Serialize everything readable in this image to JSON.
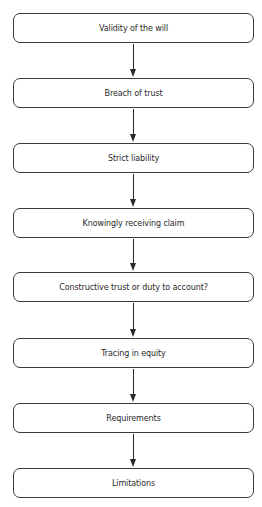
{
  "diagram": {
    "type": "vertical-flowchart",
    "colors": {
      "border": "#3a3a3a",
      "text": "#2a2a2a",
      "background": "#ffffff",
      "arrow": "#2a2a2a"
    },
    "nodes": [
      {
        "id": "n1",
        "label": "Validity of the will",
        "top": 13
      },
      {
        "id": "n2",
        "label": "Breach of trust",
        "top": 78
      },
      {
        "id": "n3",
        "label": "Strict liability",
        "top": 143
      },
      {
        "id": "n4",
        "label": "Knowingly receiving claim",
        "top": 208
      },
      {
        "id": "n5",
        "label": "Constructive trust or duty to account?",
        "top": 272
      },
      {
        "id": "n6",
        "label": "Tracing in equity",
        "top": 338
      },
      {
        "id": "n7",
        "label": "Requirements",
        "top": 403
      },
      {
        "id": "n8",
        "label": "Limitations",
        "top": 468
      }
    ],
    "edges": [
      {
        "from": "n1",
        "to": "n2"
      },
      {
        "from": "n2",
        "to": "n3"
      },
      {
        "from": "n3",
        "to": "n4"
      },
      {
        "from": "n4",
        "to": "n5"
      },
      {
        "from": "n5",
        "to": "n6"
      },
      {
        "from": "n6",
        "to": "n7"
      },
      {
        "from": "n7",
        "to": "n8"
      }
    ]
  }
}
